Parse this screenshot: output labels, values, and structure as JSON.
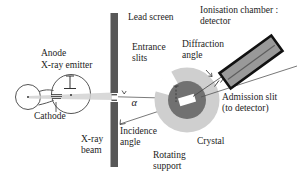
{
  "diagram_title": "X-ray diffraction apparatus schematic",
  "labels": {
    "lead_screen": "Lead screen",
    "ionisation_chamber": {
      "line1": "Ionisation chamber :",
      "line2": "detector"
    },
    "entrance_slits": {
      "line1": "Entrance",
      "line2": "slits"
    },
    "diffraction_angle": {
      "line1": "Diffraction",
      "line2": "angle"
    },
    "anode": "Anode",
    "xray_emitter": "X-ray emitter",
    "cathode": "Cathode",
    "xray_beam": {
      "line1": "X-ray",
      "line2": "beam"
    },
    "incidence_angle": {
      "line1": "Incidence",
      "line2": "angle"
    },
    "alpha_symbol": "α",
    "admission_slit": {
      "line1": "Admission slit",
      "line2": "(to detector)"
    },
    "crystal": "Crystal",
    "rotating_support": {
      "line1": "Rotating",
      "line2": "support"
    }
  },
  "colors": {
    "background": "#ffffff",
    "text": "#1c1c1c",
    "lead_screen_bar": "#575757",
    "beam": "#d2d2d2",
    "support_outer": "#cfcfcf",
    "support_inner": "#717171",
    "crystal_fill": "#ffffff",
    "detector_fill": "#999999",
    "detector_border": "#111111",
    "line": "#444444"
  }
}
